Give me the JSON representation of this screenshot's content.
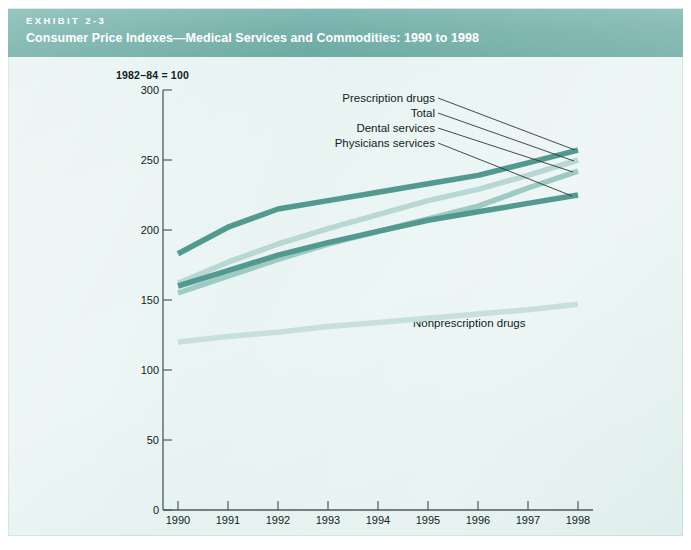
{
  "header": {
    "exhibit_tag": "EXHIBIT 2-3",
    "title": "Consumer Price Indexes—Medical Services and Commodities: 1990 to 1998",
    "band_color": "#74b0a9"
  },
  "page": {
    "background_color": "#e9f4f2"
  },
  "chart_data": {
    "type": "line",
    "title": "Consumer Price Indexes—Medical Services and Commodities: 1990 to 1998",
    "axis_note": "1982–84 = 100",
    "xlabel": "",
    "ylabel": "",
    "grid": false,
    "legend_position": "inline-labels",
    "categories": [
      1990,
      1991,
      1992,
      1993,
      1994,
      1995,
      1996,
      1997,
      1998
    ],
    "x_tick_labels": [
      "1990",
      "1991",
      "1992",
      "1993",
      "1994",
      "1995",
      "1996",
      "1997",
      "1998"
    ],
    "y_tick_labels": [
      "0",
      "50",
      "100",
      "150",
      "200",
      "250",
      "300"
    ],
    "y_ticks": [
      0,
      50,
      100,
      150,
      200,
      250,
      300
    ],
    "ylim": [
      0,
      300
    ],
    "xlim": [
      1990,
      1998
    ],
    "series": [
      {
        "name": "Prescription drugs",
        "color": "#52998f",
        "values": [
          183,
          202,
          215,
          221,
          227,
          233,
          239,
          248,
          257
        ]
      },
      {
        "name": "Total",
        "color": "#b9d8d3",
        "values": [
          162,
          177,
          190,
          201,
          211,
          221,
          229,
          239,
          250
        ]
      },
      {
        "name": "Dental services",
        "color": "#9ecac4",
        "values": [
          155,
          167,
          179,
          190,
          199,
          208,
          217,
          230,
          242
        ]
      },
      {
        "name": "Physicians services",
        "color": "#52998f",
        "values": [
          160,
          171,
          182,
          191,
          199,
          207,
          213,
          219,
          225
        ]
      },
      {
        "name": "Nonprescription drugs",
        "color": "#c7e0dc",
        "values": [
          120,
          124,
          127,
          131,
          134,
          137,
          140,
          143,
          147
        ]
      }
    ],
    "annotations": [
      {
        "text": "Prescription drugs",
        "target_year": 1998,
        "target_value": 257
      },
      {
        "text": "Total",
        "target_year": 1998,
        "target_value": 250
      },
      {
        "text": "Dental services",
        "target_year": 1998,
        "target_value": 242
      },
      {
        "text": "Physicians services",
        "target_year": 1998,
        "target_value": 225
      },
      {
        "text": "Nonprescription drugs",
        "target_year": 1996,
        "target_value": 140
      }
    ]
  }
}
